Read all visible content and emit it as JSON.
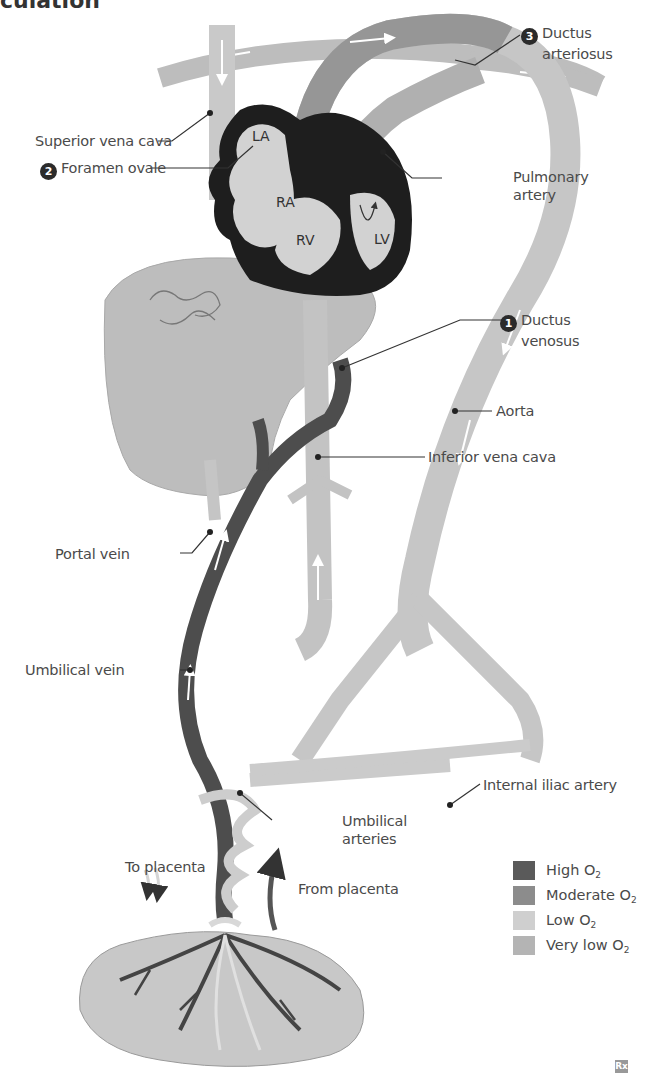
{
  "figure": {
    "title_fragment": "culation",
    "logo": "Rx"
  },
  "chambers": {
    "la": "LA",
    "ra": "RA",
    "rv": "RV",
    "lv": "LV"
  },
  "labels": {
    "ductus_arteriosus": {
      "number": "3",
      "line1": "Ductus",
      "line2": "arteriosus"
    },
    "superior_vena_cava": "Superior vena cava",
    "foramen_ovale": {
      "number": "2",
      "text": "Foramen ovale"
    },
    "pulmonary_artery": {
      "line1": "Pulmonary",
      "line2": "artery"
    },
    "ductus_venosus": {
      "number": "1",
      "line1": "Ductus",
      "line2": "venosus"
    },
    "aorta": "Aorta",
    "inferior_vena_cava": "Inferior vena cava",
    "portal_vein": "Portal vein",
    "umbilical_vein": "Umbilical vein",
    "internal_iliac_artery": "Internal iliac artery",
    "umbilical_arteries": {
      "line1": "Umbilical",
      "line2": "arteries"
    },
    "to_placenta": "To placenta",
    "from_placenta": "From placenta"
  },
  "legend": {
    "items": [
      {
        "label": "High O",
        "sub": "2",
        "color": "#5a5a5a"
      },
      {
        "label": "Moderate O",
        "sub": "2",
        "color": "#8c8c8c"
      },
      {
        "label": "Low O",
        "sub": "2",
        "color": "#cfcfcf"
      },
      {
        "label": "Very low O",
        "sub": "2",
        "color": "#b4b4b4"
      }
    ]
  },
  "colors": {
    "high": "#5a5a5a",
    "moderate": "#8c8c8c",
    "low": "#cfcfcf",
    "very_low": "#b4b4b4",
    "heart_wall": "#1e1e1e",
    "liver": "#b9b9b9",
    "placenta": "#c8c8c8"
  }
}
